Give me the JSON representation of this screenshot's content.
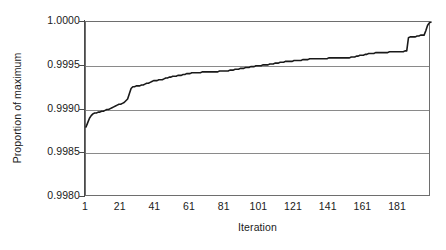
{
  "chart_data": {
    "type": "line",
    "title": "",
    "xlabel": "Iteration",
    "ylabel": "Proportion of maximum",
    "xlim": [
      1,
      200
    ],
    "ylim": [
      0.998,
      1.0
    ],
    "grid": true,
    "legend": false,
    "y_ticks": [
      "1.0000",
      "0.9995",
      "0.9990",
      "0.9985",
      "0.9980"
    ],
    "y_tick_values": [
      1.0,
      0.9995,
      0.999,
      0.9985,
      0.998
    ],
    "x_ticks": [
      "1",
      "21",
      "41",
      "61",
      "81",
      "101",
      "121",
      "141",
      "161",
      "181"
    ],
    "x_tick_values": [
      1,
      21,
      41,
      61,
      81,
      101,
      121,
      141,
      161,
      181
    ],
    "series": [
      {
        "name": "Proportion of maximum",
        "color": "#1a1a1a",
        "x": [
          1,
          2,
          3,
          4,
          5,
          6,
          7,
          8,
          9,
          10,
          11,
          12,
          13,
          14,
          15,
          16,
          17,
          18,
          19,
          20,
          21,
          22,
          23,
          24,
          25,
          26,
          27,
          28,
          29,
          30,
          31,
          32,
          33,
          34,
          35,
          36,
          37,
          38,
          39,
          40,
          41,
          42,
          43,
          44,
          45,
          46,
          47,
          48,
          49,
          50,
          51,
          52,
          53,
          54,
          55,
          56,
          57,
          58,
          59,
          60,
          61,
          62,
          63,
          64,
          65,
          66,
          67,
          68,
          69,
          70,
          71,
          72,
          73,
          74,
          75,
          76,
          77,
          78,
          79,
          80,
          81,
          82,
          83,
          84,
          85,
          86,
          87,
          88,
          89,
          90,
          91,
          92,
          93,
          94,
          95,
          96,
          97,
          98,
          99,
          100,
          101,
          102,
          103,
          104,
          105,
          106,
          107,
          108,
          109,
          110,
          111,
          112,
          113,
          114,
          115,
          116,
          117,
          118,
          119,
          120,
          121,
          122,
          123,
          124,
          125,
          126,
          127,
          128,
          129,
          130,
          131,
          132,
          133,
          134,
          135,
          136,
          137,
          138,
          139,
          140,
          141,
          142,
          143,
          144,
          145,
          146,
          147,
          148,
          149,
          150,
          151,
          152,
          153,
          154,
          155,
          156,
          157,
          158,
          159,
          160,
          161,
          162,
          163,
          164,
          165,
          166,
          167,
          168,
          169,
          170,
          171,
          172,
          173,
          174,
          175,
          176,
          177,
          178,
          179,
          180,
          181,
          182,
          183,
          184,
          185,
          186,
          187,
          188,
          189,
          190,
          191,
          192,
          193,
          194,
          195,
          196,
          197,
          198,
          199,
          200
        ],
        "y": [
          0.9988,
          0.99885,
          0.9989,
          0.99893,
          0.99895,
          0.99896,
          0.99896,
          0.99897,
          0.99897,
          0.99898,
          0.99898,
          0.99899,
          0.999,
          0.999,
          0.99901,
          0.99902,
          0.99903,
          0.99904,
          0.99905,
          0.99906,
          0.99906,
          0.99907,
          0.99908,
          0.9991,
          0.99912,
          0.99918,
          0.99924,
          0.99926,
          0.99926,
          0.99927,
          0.99927,
          0.99927,
          0.99928,
          0.99928,
          0.99929,
          0.9993,
          0.9993,
          0.99931,
          0.99932,
          0.99933,
          0.99933,
          0.99933,
          0.99934,
          0.99934,
          0.99934,
          0.99935,
          0.99936,
          0.99936,
          0.99937,
          0.99937,
          0.99938,
          0.99938,
          0.99938,
          0.99939,
          0.99939,
          0.99939,
          0.9994,
          0.9994,
          0.99941,
          0.99941,
          0.99941,
          0.99942,
          0.99942,
          0.99942,
          0.99942,
          0.99942,
          0.99942,
          0.99943,
          0.99943,
          0.99943,
          0.99943,
          0.99943,
          0.99943,
          0.99943,
          0.99943,
          0.99943,
          0.99943,
          0.99944,
          0.99944,
          0.99944,
          0.99944,
          0.99944,
          0.99944,
          0.99945,
          0.99945,
          0.99945,
          0.99946,
          0.99946,
          0.99946,
          0.99947,
          0.99947,
          0.99947,
          0.99948,
          0.99948,
          0.99948,
          0.99949,
          0.99949,
          0.99949,
          0.9995,
          0.9995,
          0.9995,
          0.9995,
          0.99951,
          0.99951,
          0.99951,
          0.99951,
          0.99952,
          0.99952,
          0.99952,
          0.99953,
          0.99953,
          0.99953,
          0.99954,
          0.99954,
          0.99954,
          0.99955,
          0.99955,
          0.99955,
          0.99955,
          0.99955,
          0.99956,
          0.99956,
          0.99956,
          0.99956,
          0.99956,
          0.99957,
          0.99957,
          0.99957,
          0.99957,
          0.99958,
          0.99958,
          0.99958,
          0.99958,
          0.99958,
          0.99958,
          0.99958,
          0.99958,
          0.99958,
          0.99958,
          0.99958,
          0.99959,
          0.99959,
          0.99959,
          0.99959,
          0.99959,
          0.99959,
          0.99959,
          0.99959,
          0.99959,
          0.99959,
          0.99959,
          0.99959,
          0.99959,
          0.9996,
          0.9996,
          0.9996,
          0.99961,
          0.99961,
          0.99962,
          0.99962,
          0.99962,
          0.99963,
          0.99963,
          0.99964,
          0.99964,
          0.99964,
          0.99964,
          0.99965,
          0.99965,
          0.99965,
          0.99965,
          0.99965,
          0.99965,
          0.99965,
          0.99965,
          0.99966,
          0.99966,
          0.99966,
          0.99966,
          0.99966,
          0.99966,
          0.99966,
          0.99966,
          0.99966,
          0.99967,
          0.99967,
          0.99982,
          0.99983,
          0.99983,
          0.99983,
          0.99983,
          0.99984,
          0.99984,
          0.99985,
          0.99985,
          0.99985,
          0.9999,
          0.99996,
          0.99999,
          1.0
        ]
      }
    ]
  },
  "axes": {
    "y_title": "Proportion of maximum",
    "x_title": "Iteration"
  }
}
